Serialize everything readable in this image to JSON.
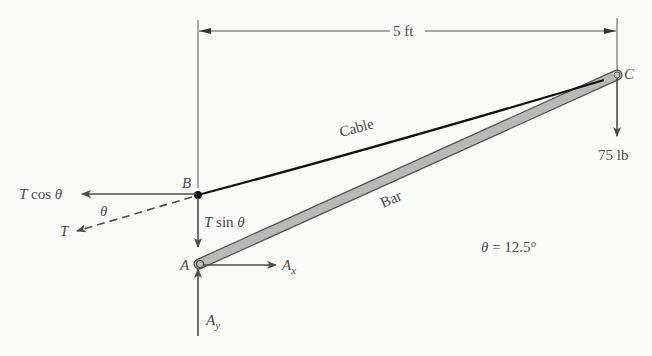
{
  "dimension": {
    "label": "5 ft"
  },
  "points": {
    "A": "A",
    "B": "B",
    "C": "C"
  },
  "members": {
    "cable": "Cable",
    "bar": "Bar"
  },
  "forces": {
    "t_cos": {
      "T": "T",
      "op": " cos ",
      "theta": "θ"
    },
    "t_sin": {
      "T": "T",
      "op": " sin ",
      "theta": "θ"
    },
    "t": "T",
    "theta_angle": "θ",
    "ax": {
      "base": "A",
      "sub": "x"
    },
    "ay": {
      "base": "A",
      "sub": "y"
    },
    "load": "75 lb"
  },
  "given": {
    "theta": "θ",
    "eq": " = 12.5°"
  },
  "colors": {
    "cable": "#111111",
    "bar_fill": "#b9b9b9",
    "bar_edge": "#555555",
    "arrow": "#4d4d4d",
    "text": "#4a4a4a"
  }
}
